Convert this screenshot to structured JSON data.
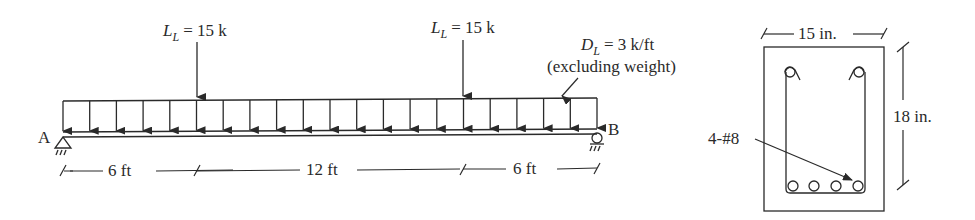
{
  "diagram": {
    "beam": {
      "support_left": "A",
      "support_right": "B",
      "point_loads": [
        {
          "symbol": "L",
          "subscript": "L",
          "value": "= 15 k",
          "position_ft": 6
        },
        {
          "symbol": "L",
          "subscript": "L",
          "value": "= 15 k",
          "position_ft": 18
        }
      ],
      "distributed_load": {
        "symbol": "D",
        "subscript": "L",
        "value": "= 3 k/ft",
        "note": "(excluding weight)"
      },
      "dimensions": [
        "6 ft",
        "12 ft",
        "6 ft"
      ]
    },
    "section": {
      "width": "15 in.",
      "height": "18 in.",
      "reinforcement": "4-#8"
    }
  },
  "colors": {
    "line": "#2a2a2a",
    "background": "#ffffff"
  }
}
